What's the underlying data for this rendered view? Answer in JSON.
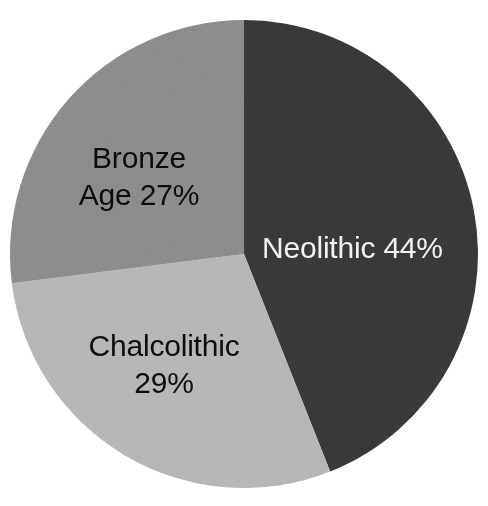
{
  "chart_data": {
    "type": "pie",
    "title": "",
    "subtitle": "",
    "xlabel": "",
    "ylabel": "",
    "legend_position": "none",
    "grid": false,
    "labels_inside_slices": true,
    "total_percent": 100,
    "categories": [
      "Neolithic",
      "Chalcolithic",
      "Bronze Age"
    ],
    "values": [
      44,
      29,
      27
    ],
    "slices": [
      {
        "name": "Neolithic",
        "value": 44,
        "label": "Neolithic 44%",
        "percent_text": "44%",
        "color": "#373737",
        "label_color": "#f2f2f2",
        "start_angle_deg": 0,
        "end_angle_deg": 158.4
      },
      {
        "name": "Chalcolithic",
        "value": 29,
        "label": "Chalcolithic\n29%",
        "percent_text": "29%",
        "color": "#b4b4b4",
        "label_color": "#0d0d0d",
        "start_angle_deg": 158.4,
        "end_angle_deg": 262.8
      },
      {
        "name": "Bronze Age",
        "value": 27,
        "label": "Bronze\nAge 27%",
        "percent_text": "27%",
        "color": "#888888",
        "label_color": "#0d0d0d",
        "start_angle_deg": 262.8,
        "end_angle_deg": 360
      }
    ],
    "geometry": {
      "center_x": 244,
      "center_y": 254,
      "radius": 234
    },
    "background_color": "#ffffff"
  }
}
